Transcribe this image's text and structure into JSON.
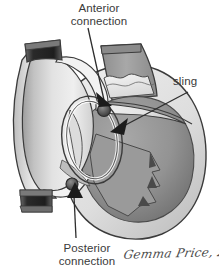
{
  "figure": {
    "domain": "medical-anatomical-illustration",
    "background_color": "#ffffff",
    "width": 219,
    "height": 271
  },
  "labels": {
    "anterior": "Anterior\nconnection",
    "anterior_line1": "Anterior",
    "anterior_line2": "connection",
    "sling": "sling",
    "posterior": "Posterior\nconnection",
    "posterior_line1": "Posterior",
    "posterior_line2": "connection"
  },
  "signature": {
    "text": "Gemma Price, 2004",
    "artist": "Gemma Price",
    "year": "2004"
  },
  "palette": {
    "background": "#ffffff",
    "outline": "#3b3b3b",
    "text": "#3a3a3a",
    "wall_light": "#e9e9e9",
    "wall_mid": "#c9c9c9",
    "chamber_light": "#dcdcdc",
    "chamber_pale": "#f0f0f0",
    "chamber_mid": "#b4b4b4",
    "chamber_dark": "#8f8f8f",
    "muscle_gray": "#9a9a9a",
    "vessel_dark": "#2b2b2b",
    "vessel_band": "#6e6e6e",
    "arrow_fill": "#1c1c1c",
    "leader_line": "#2e2e2e"
  },
  "structures": [
    {
      "name": "left-pouch-chamber",
      "description": "large rounded pale chamber on the left side"
    },
    {
      "name": "left-pouch-upper-cuff",
      "description": "dark transected vessel cuff at top of left chamber"
    },
    {
      "name": "left-pouch-lower-cuff",
      "description": "dark transected vessel cuff at bottom of left chamber"
    },
    {
      "name": "superior-vessel-trunk",
      "description": "grey vessel trunk entering from top right"
    },
    {
      "name": "valve-leaflets",
      "description": "scalloped valve region inside superior trunk"
    },
    {
      "name": "ventricular-cavity",
      "description": "large dark-grey cavity on the right"
    },
    {
      "name": "papillary-muscle",
      "description": "fan-shaped trabeculated muscle in the right cavity"
    },
    {
      "name": "myocardial-wall",
      "description": "pale thick wall surrounding the right cavity"
    },
    {
      "name": "sling-band",
      "description": "band crossing obliquely through the centre"
    },
    {
      "name": "anterior-connection-node",
      "description": "dark nodule at the upper junction"
    },
    {
      "name": "posterior-connection-node",
      "description": "dark nodule at the lower junction"
    }
  ],
  "annotations": [
    {
      "name": "anterior-connection-pointer",
      "target": "anterior-connection-node"
    },
    {
      "name": "sling-pointer",
      "target": "sling-band"
    },
    {
      "name": "posterior-connection-pointer",
      "target": "posterior-connection-node"
    }
  ]
}
